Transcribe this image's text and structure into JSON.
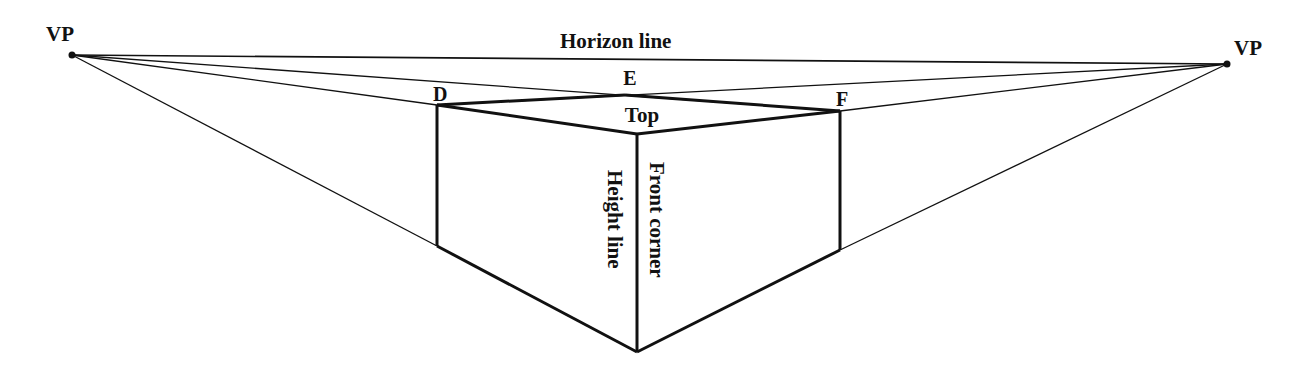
{
  "diagram": {
    "colors": {
      "line": "#111111",
      "background": "#ffffff"
    },
    "labels": {
      "vp_left": "VP",
      "vp_right": "VP",
      "horizon": "Horizon line",
      "d": "D",
      "e": "E",
      "f": "F",
      "top": "Top",
      "height_line": "Height line",
      "front_corner": "Front corner"
    },
    "points": {
      "vp_left": [
        72,
        55
      ],
      "vp_right": [
        1227,
        64
      ],
      "D": [
        437,
        105
      ],
      "E": [
        625,
        95
      ],
      "F": [
        840,
        111
      ],
      "front_top": [
        637,
        134
      ],
      "left_bottom": [
        437,
        246
      ],
      "right_bottom": [
        840,
        250
      ],
      "front_bottom": [
        637,
        352
      ]
    }
  }
}
